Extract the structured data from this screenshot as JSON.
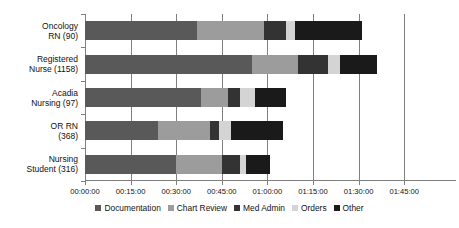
{
  "chart_data": {
    "type": "bar",
    "orientation": "horizontal",
    "stacked": true,
    "title": "",
    "xlabel": "",
    "ylabel": "",
    "grid": true,
    "legend_position": "bottom",
    "xlim": [
      "00:00:00",
      "01:45:00"
    ],
    "x_tick_labels": [
      "00:00:00",
      "00:15:00",
      "00:30:00",
      "00:45:00",
      "01:00:00",
      "01:15:00",
      "01:30:00",
      "01:45:00"
    ],
    "x_tick_minutes": [
      0,
      15,
      30,
      45,
      60,
      75,
      90,
      105
    ],
    "categories": [
      "Oncology RN (90)",
      "Registered Nurse (1158)",
      "Acadia Nursing (97)",
      "OR RN (368)",
      "Nursing Student (316)"
    ],
    "category_lines": [
      [
        "Oncology",
        "RN (90)"
      ],
      [
        "Registered",
        "Nurse (1158)"
      ],
      [
        "Acadia",
        "Nursing (97)"
      ],
      [
        "OR RN",
        "(368)"
      ],
      [
        "Nursing",
        "Student (316)"
      ]
    ],
    "series": [
      {
        "name": "Documentation",
        "color": "#595959",
        "values_minutes": [
          37,
          55,
          38,
          24,
          30
        ]
      },
      {
        "name": "Chart Review",
        "color": "#9c9c9c",
        "values_minutes": [
          22,
          15,
          9,
          17,
          15
        ]
      },
      {
        "name": "Med Admin",
        "color": "#333333",
        "values_minutes": [
          7,
          10,
          4,
          3,
          6
        ]
      },
      {
        "name": "Orders",
        "color": "#d4d4d4",
        "values_minutes": [
          3,
          4,
          5,
          4,
          2
        ]
      },
      {
        "name": "Other",
        "color": "#1a1a1a",
        "values_minutes": [
          22,
          12,
          10,
          17,
          8
        ]
      }
    ],
    "totals_minutes": [
      91,
      96,
      66,
      65,
      61
    ]
  },
  "colors": {
    "axis": "#808080",
    "text": "#111111",
    "background": "#ffffff"
  }
}
